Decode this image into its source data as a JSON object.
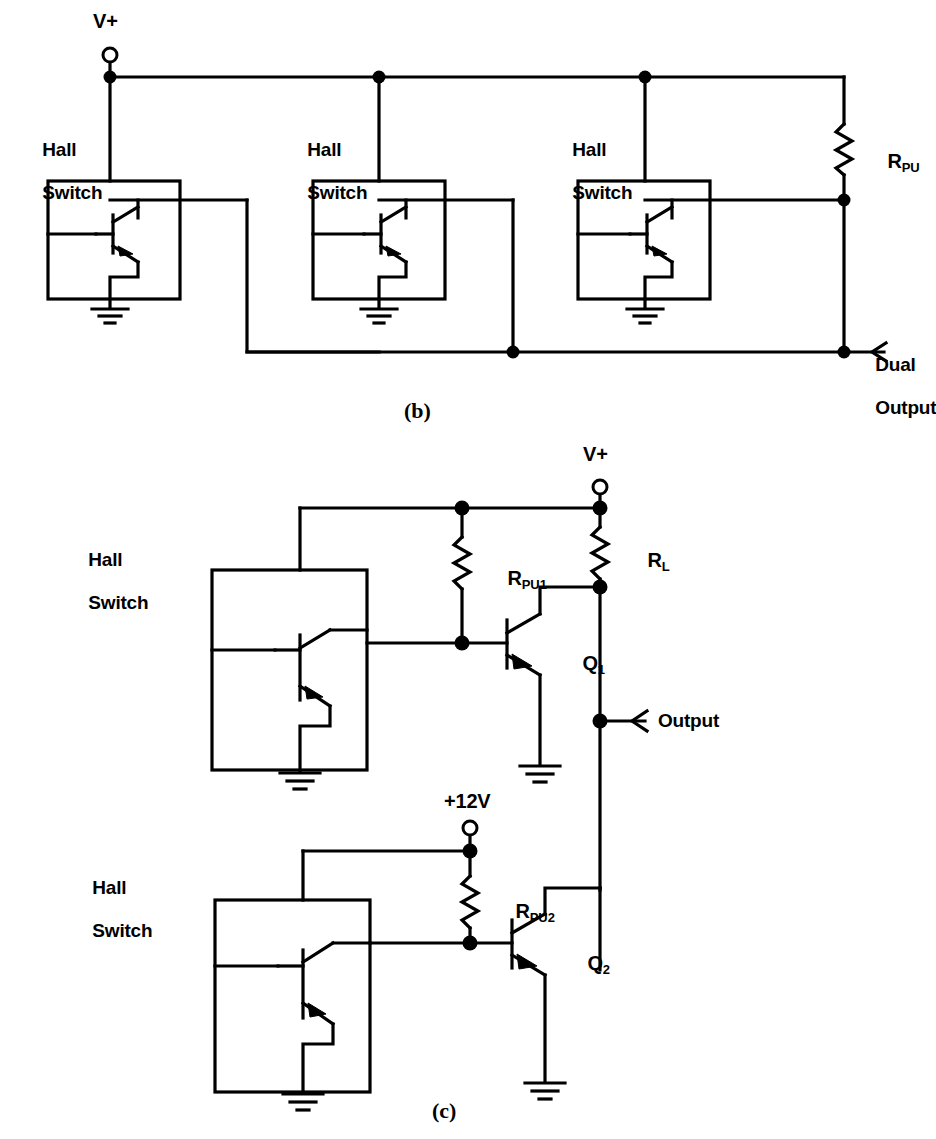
{
  "page": {
    "background_color": "#ffffff",
    "ink_color": "#000000",
    "width": 928,
    "height": 1139
  },
  "figures": [
    {
      "id": "b",
      "caption": "(b)",
      "title": "Three Hall switches wire-OR'd to a single pull-up resistor"
    },
    {
      "id": "c",
      "caption": "(c)",
      "title": "Two Hall switches driving NPN buffer transistors"
    }
  ],
  "figure_b": {
    "caption": "(b)",
    "supply_label": "V+",
    "blocks": [
      {
        "label_line1": "Hall",
        "label_line2": "Switch"
      },
      {
        "label_line1": "Hall",
        "label_line2": "Switch"
      },
      {
        "label_line1": "Hall",
        "label_line2": "Switch"
      }
    ],
    "resistor": {
      "label": "R",
      "subscript": "PU"
    },
    "output": {
      "line1": "Dual",
      "line2": "Output"
    },
    "ground_count": 3
  },
  "figure_c": {
    "caption": "(c)",
    "supply_top_label": "V+",
    "supply_bottom_label": "+12V",
    "blocks": [
      {
        "label_line1": "Hall",
        "label_line2": "Switch"
      },
      {
        "label_line1": "Hall",
        "label_line2": "Switch"
      }
    ],
    "resistors": [
      {
        "label": "R",
        "subscript": "PU1"
      },
      {
        "label": "R",
        "subscript": "L"
      },
      {
        "label": "R",
        "subscript": "PU2"
      }
    ],
    "transistors": [
      {
        "label": "Q",
        "subscript": "1",
        "type": "NPN"
      },
      {
        "label": "Q",
        "subscript": "2",
        "type": "NPN"
      }
    ],
    "output": {
      "line1": "Output"
    },
    "ground_count": 4
  }
}
